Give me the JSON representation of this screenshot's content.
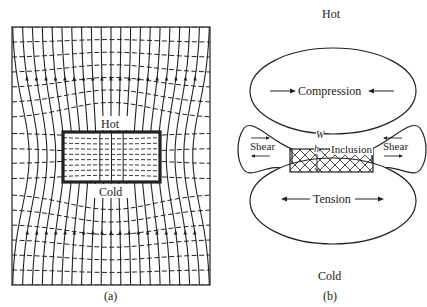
{
  "panel_a": {
    "hot_label": "Hot",
    "cold_label": "Cold",
    "caption": "(a)"
  },
  "panel_b": {
    "hot_label": "Hot",
    "cold_label": "Cold",
    "compression_label": "Compression",
    "tension_label": "Tension",
    "shear_left_label": "Shear",
    "shear_right_label": "Shear",
    "inclusion_label": "Inclusion",
    "width_symbol": "W",
    "height_symbol": "h",
    "caption": "(b)"
  },
  "colors": {
    "ink": "#222222",
    "background": "#ffffff"
  }
}
